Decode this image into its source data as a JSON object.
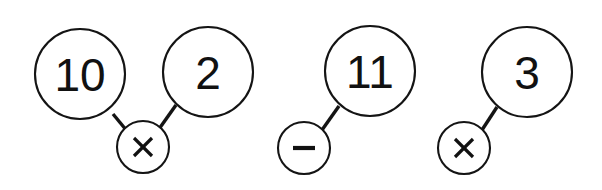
{
  "canvas": {
    "width": 602,
    "height": 190,
    "background_color": "#ffffff",
    "stroke_color": "#141414"
  },
  "diagram": {
    "type": "number-bond-operator-pairs",
    "groups": [
      {
        "id": "group-1",
        "nodes": [
          {
            "id": "node-10",
            "label": "10",
            "cx": 80,
            "cy": 74,
            "r": 45
          },
          {
            "id": "node-2",
            "label": "2",
            "cx": 208,
            "cy": 72,
            "r": 45
          }
        ],
        "operator": {
          "id": "op-times-1",
          "symbol": "×",
          "symbol_name": "multiplication-sign",
          "cx": 143,
          "cy": 147,
          "r": 26
        },
        "connectors": [
          {
            "from": "node-10",
            "to": "op-times-1",
            "x1": 113,
            "y1": 114,
            "x2": 127,
            "y2": 131
          },
          {
            "from": "node-2",
            "to": "op-times-1",
            "x1": 176,
            "y1": 105,
            "x2": 159,
            "y2": 129
          }
        ]
      },
      {
        "id": "group-2",
        "nodes": [
          {
            "id": "node-11",
            "label": "11",
            "cx": 370,
            "cy": 71,
            "r": 45
          },
          {
            "id": "node-3",
            "label": "3",
            "cx": 527,
            "cy": 72,
            "r": 45
          }
        ],
        "operators": [
          {
            "id": "op-minus-1",
            "symbol": "−",
            "symbol_name": "minus-sign",
            "cx": 304,
            "cy": 148,
            "r": 26
          },
          {
            "id": "op-times-2",
            "symbol": "×",
            "symbol_name": "multiplication-sign",
            "cx": 464,
            "cy": 148,
            "r": 26
          }
        ],
        "connectors": [
          {
            "from": "op-minus-1",
            "to": "node-11",
            "x1": 322,
            "y1": 130,
            "x2": 339,
            "y2": 106
          },
          {
            "from": "op-times-2",
            "to": "node-3",
            "x1": 482,
            "y1": 130,
            "x2": 497,
            "y2": 107
          }
        ]
      }
    ],
    "all_labels": [
      "10",
      "2",
      "×",
      "11",
      "−",
      "3",
      "×"
    ]
  }
}
